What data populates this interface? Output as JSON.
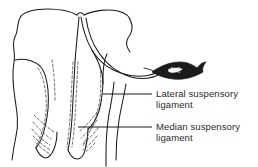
{
  "figure": {
    "background_color": "#ffffff",
    "ink_color": "#1a1a1a",
    "dashed_ink_color": "#555555",
    "text_color": "#2b2b2b",
    "shaded_fill_color": "#1c1c1c"
  },
  "labels": [
    {
      "id": "lateral",
      "text": "Lateral suspensory\nligament",
      "line1": "Lateral suspensory",
      "line2": "ligament",
      "leader": {
        "x1": 103,
        "y1": 94,
        "x2": 152,
        "y2": 94
      }
    },
    {
      "id": "median",
      "text": "Median suspensory\nligament",
      "line1": "Median suspensory",
      "line2": "ligament",
      "leader": {
        "x1": 78,
        "y1": 127,
        "x2": 152,
        "y2": 127
      }
    }
  ],
  "parts": [
    {
      "name": "body-outline-left",
      "kind": "solid-contour"
    },
    {
      "name": "udder-left-lobe",
      "kind": "solid-contour"
    },
    {
      "name": "udder-right-lobe",
      "kind": "solid-contour"
    },
    {
      "name": "median-cleft",
      "kind": "solid-contour"
    },
    {
      "name": "teat-left",
      "kind": "solid-contour"
    },
    {
      "name": "teat-right",
      "kind": "solid-contour"
    },
    {
      "name": "lateral-suspensory-band",
      "kind": "solid-contour"
    },
    {
      "name": "median-suspensory-dashed",
      "kind": "dashed-contour"
    },
    {
      "name": "glandular-hatching-left",
      "kind": "dashed-contour"
    },
    {
      "name": "glandular-hatching-right",
      "kind": "dashed-contour"
    },
    {
      "name": "shaded-ligament-attachment",
      "kind": "filled-shape"
    },
    {
      "name": "hind-leg-contour",
      "kind": "solid-contour"
    }
  ]
}
